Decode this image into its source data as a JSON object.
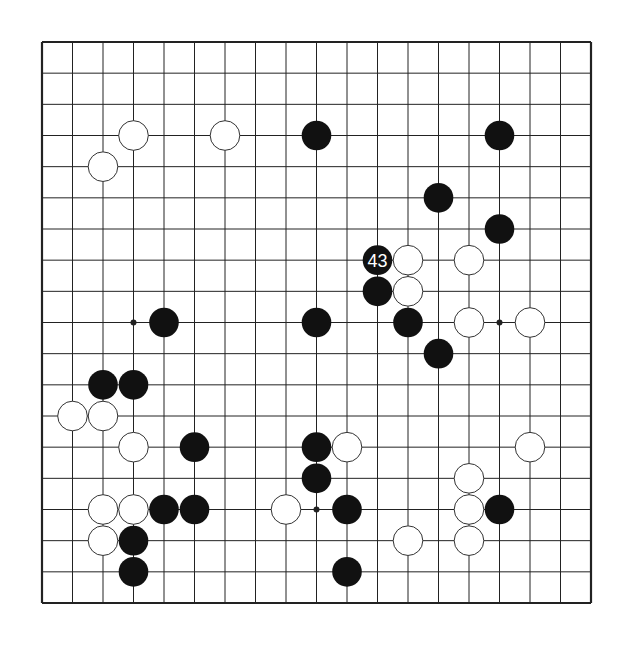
{
  "diagram": {
    "type": "go-board",
    "board_size": 19,
    "colors": {
      "background": "#ffffff",
      "line": "#222222",
      "black_stone": "#111111",
      "white_stone": "#ffffff",
      "stone_outline": "#333333",
      "label_on_black": "#ffffff"
    },
    "star_points": [
      [
        3,
        3
      ],
      [
        9,
        3
      ],
      [
        15,
        3
      ],
      [
        3,
        9
      ],
      [
        9,
        9
      ],
      [
        15,
        9
      ],
      [
        3,
        15
      ],
      [
        9,
        15
      ],
      [
        15,
        15
      ]
    ],
    "stones": [
      {
        "color": "white",
        "col": 3,
        "row": 3
      },
      {
        "color": "white",
        "col": 6,
        "row": 3
      },
      {
        "color": "black",
        "col": 9,
        "row": 3
      },
      {
        "color": "black",
        "col": 15,
        "row": 3
      },
      {
        "color": "white",
        "col": 2,
        "row": 4
      },
      {
        "color": "black",
        "col": 13,
        "row": 5
      },
      {
        "color": "black",
        "col": 15,
        "row": 6
      },
      {
        "color": "black",
        "col": 11,
        "row": 7,
        "label": "43"
      },
      {
        "color": "white",
        "col": 12,
        "row": 7
      },
      {
        "color": "white",
        "col": 14,
        "row": 7
      },
      {
        "color": "black",
        "col": 11,
        "row": 8
      },
      {
        "color": "white",
        "col": 12,
        "row": 8
      },
      {
        "color": "black",
        "col": 4,
        "row": 9
      },
      {
        "color": "black",
        "col": 9,
        "row": 9
      },
      {
        "color": "black",
        "col": 12,
        "row": 9
      },
      {
        "color": "white",
        "col": 14,
        "row": 9
      },
      {
        "color": "white",
        "col": 16,
        "row": 9
      },
      {
        "color": "black",
        "col": 13,
        "row": 10
      },
      {
        "color": "black",
        "col": 2,
        "row": 11
      },
      {
        "color": "black",
        "col": 3,
        "row": 11
      },
      {
        "color": "white",
        "col": 1,
        "row": 12
      },
      {
        "color": "white",
        "col": 2,
        "row": 12
      },
      {
        "color": "white",
        "col": 3,
        "row": 13
      },
      {
        "color": "black",
        "col": 5,
        "row": 13
      },
      {
        "color": "black",
        "col": 9,
        "row": 13
      },
      {
        "color": "white",
        "col": 10,
        "row": 13
      },
      {
        "color": "white",
        "col": 16,
        "row": 13
      },
      {
        "color": "black",
        "col": 9,
        "row": 14
      },
      {
        "color": "white",
        "col": 14,
        "row": 14
      },
      {
        "color": "white",
        "col": 2,
        "row": 15
      },
      {
        "color": "white",
        "col": 3,
        "row": 15
      },
      {
        "color": "black",
        "col": 4,
        "row": 15
      },
      {
        "color": "black",
        "col": 5,
        "row": 15
      },
      {
        "color": "white",
        "col": 8,
        "row": 15
      },
      {
        "color": "black",
        "col": 10,
        "row": 15
      },
      {
        "color": "white",
        "col": 14,
        "row": 15
      },
      {
        "color": "black",
        "col": 15,
        "row": 15
      },
      {
        "color": "white",
        "col": 2,
        "row": 16
      },
      {
        "color": "black",
        "col": 3,
        "row": 16
      },
      {
        "color": "white",
        "col": 12,
        "row": 16
      },
      {
        "color": "white",
        "col": 14,
        "row": 16
      },
      {
        "color": "black",
        "col": 3,
        "row": 17
      },
      {
        "color": "black",
        "col": 10,
        "row": 17
      }
    ],
    "move_labels": [
      {
        "text": "43",
        "col": 11,
        "row": 7
      }
    ]
  }
}
